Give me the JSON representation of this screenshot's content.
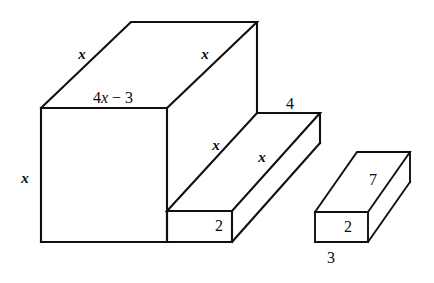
{
  "figure": {
    "background_color": "#ffffff",
    "line_color": "#101010"
  },
  "large_solid": {
    "name": "step-solid",
    "labels": {
      "top_left_depth": "x",
      "top_right_depth": "x",
      "front_top_width": "4x − 3",
      "front_height": "x",
      "step_top_near_depth": "x",
      "step_top_far_depth": "x",
      "step_back_width": "4",
      "step_front_height": "2"
    }
  },
  "small_solid": {
    "name": "small-box",
    "labels": {
      "depth": "7",
      "height": "2",
      "width": "3"
    }
  },
  "label_list": [
    {
      "id": "x-top-left",
      "text": "x",
      "kind": "variable"
    },
    {
      "id": "x-top-right",
      "text": "x",
      "kind": "variable"
    },
    {
      "id": "four-x-minus-three",
      "text": "4x − 3",
      "kind": "expression"
    },
    {
      "id": "x-front-height",
      "text": "x",
      "kind": "variable"
    },
    {
      "id": "x-step-near",
      "text": "x",
      "kind": "variable"
    },
    {
      "id": "x-step-far",
      "text": "x",
      "kind": "variable"
    },
    {
      "id": "four-step-back",
      "text": "4",
      "kind": "number"
    },
    {
      "id": "two-step-front",
      "text": "2",
      "kind": "number"
    },
    {
      "id": "seven-small-depth",
      "text": "7",
      "kind": "number"
    },
    {
      "id": "two-small-height",
      "text": "2",
      "kind": "number"
    },
    {
      "id": "three-small-width",
      "text": "3",
      "kind": "number"
    }
  ],
  "expression_parts": {
    "coefficient": "4",
    "variable": "x",
    "operator_and_constant": " − 3"
  }
}
